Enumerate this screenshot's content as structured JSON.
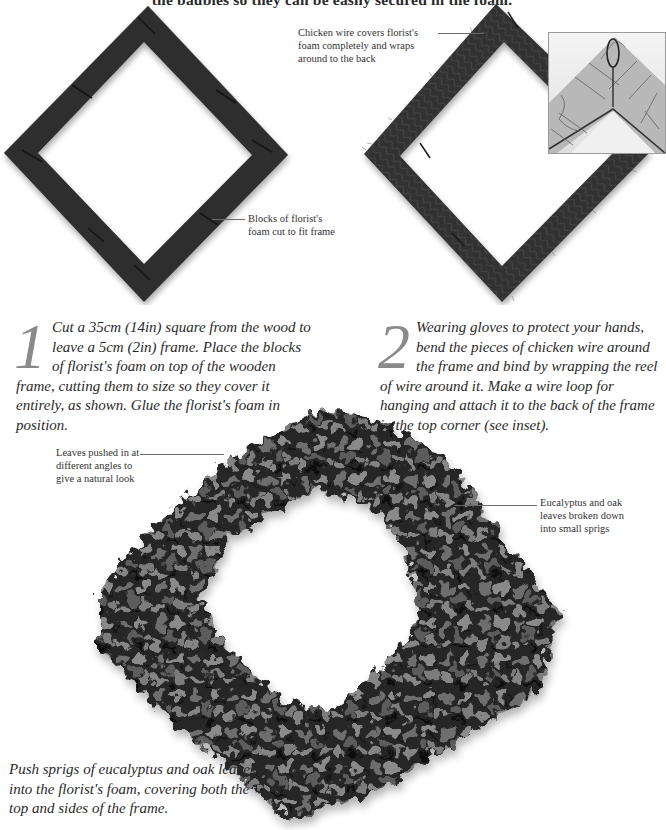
{
  "intro": {
    "text_cropped": "the baubles so they can be easily secured in the foam."
  },
  "illustrations": {
    "frame_foam": {
      "alt": "square wooden frame covered with dark blocks of florist's foam, rotated 45 degrees"
    },
    "frame_wire": {
      "alt": "foam frame wrapped in chicken wire, rotated 45 degrees"
    },
    "inset": {
      "alt": "close-up of wire hanging loop attached at the top corner on the back of the frame"
    },
    "wreath": {
      "alt": "finished diamond-shaped wreath of eucalyptus and oak leaves"
    }
  },
  "callouts": {
    "chicken_wire": [
      "Chicken wire covers florist's",
      "foam completely and wraps",
      "around to the back"
    ],
    "foam_blocks": [
      "Blocks of florist's",
      "foam cut to fit frame"
    ],
    "leaves_angles": [
      "Leaves pushed in at",
      "different angles to",
      "give a natural look"
    ],
    "eucalyptus": [
      "Eucalyptus and oak",
      "leaves broken down",
      "into small sprigs"
    ]
  },
  "steps": [
    {
      "number": "1",
      "text": "Cut a 35cm (14in) square from the wood  to leave a 5cm (2in) frame. Place the blocks of florist's foam on top of the wooden frame, cutting them to size so they cover it entirely, as shown. Glue the florist's foam in position."
    },
    {
      "number": "2",
      "text": "Wearing gloves to protect your hands, bend the pieces of chicken wire around the frame and bind by wrapping the reel of wire around it. Make a wire loop for hanging and attach it to the back of the frame in the top corner (see inset)."
    },
    {
      "number": "3",
      "text": "Push sprigs of eucalyptus and oak leaves into the florist's foam, covering both the top and sides of the frame."
    }
  ],
  "colors": {
    "text": "#2a2a2a",
    "numeral": "#8a8a8a",
    "foam": "#2f2f2f",
    "leaf_dark": "#1a1a1a",
    "leaf_mid": "#5a5a5a",
    "leaf_light": "#8c8c8c"
  }
}
